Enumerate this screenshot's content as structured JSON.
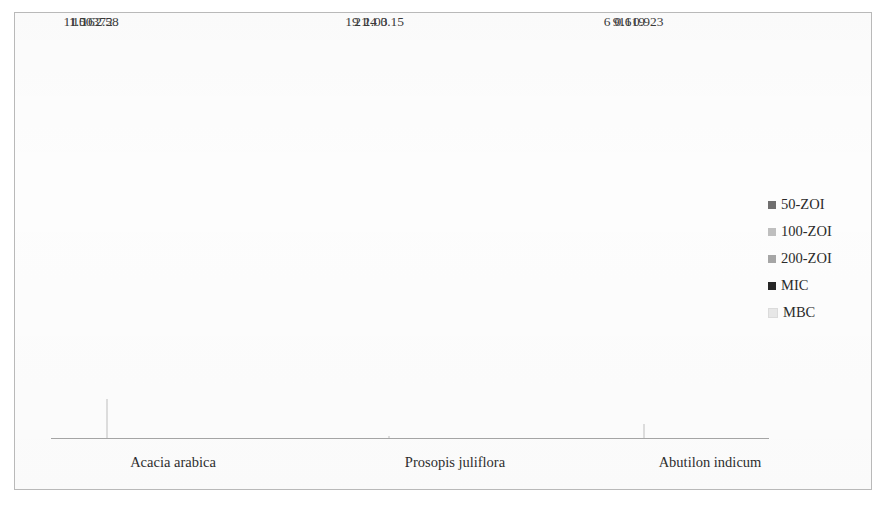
{
  "figure": {
    "frame_border_color": "#b9b9b9",
    "background_color": "#ffffff",
    "axis_line_color": "#a6a6a6"
  },
  "legend": {
    "position": "right",
    "items": [
      {
        "label": "50-ZOI",
        "color": "#706f6f"
      },
      {
        "label": "100-ZOI",
        "color": "#bfbfbf"
      },
      {
        "label": "200-ZOI",
        "color": "#a6a6a6"
      },
      {
        "label": "MIC",
        "color": "#262626"
      },
      {
        "label": "MBC",
        "color": "#e8e8e8"
      }
    ]
  },
  "chart_data": {
    "type": "bar",
    "title": "",
    "xlabel": "",
    "ylabel": "",
    "grid": false,
    "legend_position": "right",
    "ylim": [
      0,
      27
    ],
    "categories": [
      "Acacia arabica",
      "Prosopis juliflora",
      "Abutilon indicum"
    ],
    "series": [
      {
        "name": "50-ZOI",
        "color": "#706f6f",
        "values": [
          11,
          19,
          6
        ],
        "labels": [
          "11",
          "19",
          "6"
        ]
      },
      {
        "name": "100-ZOI",
        "color": "#bfbfbf",
        "values": [
          15,
          21,
          9
        ],
        "labels": [
          "15",
          "21",
          "9"
        ]
      },
      {
        "name": "200-ZOI",
        "color": "#a6a6a6",
        "values": [
          16,
          24,
          11
        ],
        "labels": [
          "16",
          "24",
          "11"
        ]
      },
      {
        "name": "MIC",
        "color": "#262626",
        "values": [
          1.00372,
          1.03,
          0.619
        ],
        "labels": [
          "1.00372",
          "1.03",
          "0.619"
        ]
      },
      {
        "name": "MBC",
        "color": "#e8e8e8",
        "values": [
          2.58,
          0.15,
          0.923
        ],
        "labels": [
          "2.58",
          "0.15",
          "0.923"
        ]
      }
    ]
  }
}
